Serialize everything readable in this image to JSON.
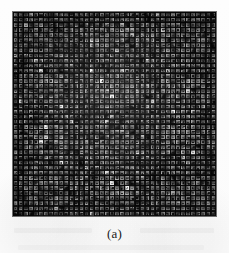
{
  "figure": {
    "caption": "(a)",
    "panel_label": "a",
    "background_color": "#fdfdfd",
    "panel_background_color": "#0a0a0a",
    "panel_left_px": 13,
    "panel_top_px": 12,
    "panel_width_px": 203,
    "panel_height_px": 204
  },
  "chart_data": {
    "type": "heatmap",
    "title": "(a)",
    "subtitle": "",
    "xlabel": "",
    "ylabel": "",
    "grid_cols": 40,
    "grid_rows": 40,
    "cell_count": 1600,
    "colormap": "grayscale",
    "value_range": [
      0,
      255
    ],
    "background_value": 10,
    "mean_cell_brightness": 92,
    "grid": true,
    "legend": false,
    "tick_labels_x": [],
    "tick_labels_y": [],
    "annotations": [
      {
        "text": "(a)",
        "position": "below-panel",
        "align": "center"
      }
    ],
    "bright_cells": [
      {
        "col": 15,
        "row": 11,
        "value": 248
      },
      {
        "col": 17,
        "row": 13,
        "value": 244
      },
      {
        "col": 19,
        "row": 16,
        "value": 246
      },
      {
        "col": 6,
        "row": 22,
        "value": 240
      },
      {
        "col": 5,
        "row": 25,
        "value": 238
      },
      {
        "col": 9,
        "row": 29,
        "value": 236
      },
      {
        "col": 26,
        "row": 9,
        "value": 234
      },
      {
        "col": 31,
        "row": 19,
        "value": 232
      },
      {
        "col": 22,
        "row": 34,
        "value": 230
      },
      {
        "col": 35,
        "row": 27,
        "value": 228
      }
    ]
  }
}
